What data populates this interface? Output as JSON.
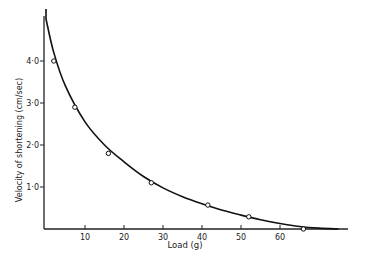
{
  "chart_data": {
    "type": "scatter",
    "title": "",
    "xlabel": "Load (g)",
    "ylabel": "Velocity of shortening (cm/sec)",
    "xlim": [
      0,
      76
    ],
    "ylim": [
      0,
      5.2
    ],
    "x_ticks": [
      10,
      20,
      30,
      40,
      50,
      60
    ],
    "x_tick_labels": [
      "10",
      "20",
      "30",
      "40",
      "50",
      "60"
    ],
    "y_ticks": [
      1.0,
      2.0,
      3.0,
      4.0
    ],
    "y_tick_labels": [
      "1·0",
      "2·0",
      "3·0",
      "4·0"
    ],
    "grid": false,
    "legend": null,
    "series": [
      {
        "name": "measured",
        "marker": "open-circle",
        "x": [
          2,
          7.4,
          16,
          27,
          41.5,
          52,
          66
        ],
        "y": [
          4.0,
          2.9,
          1.8,
          1.1,
          0.57,
          0.29,
          0.0
        ]
      },
      {
        "name": "fitted curve",
        "style": "solid-line",
        "x": [
          0,
          2,
          5,
          10,
          15,
          20,
          25,
          30,
          35,
          40,
          45,
          50,
          55,
          60,
          65,
          70,
          75
        ],
        "y": [
          5.0,
          4.2,
          3.4,
          2.55,
          2.0,
          1.6,
          1.25,
          0.98,
          0.77,
          0.6,
          0.45,
          0.33,
          0.22,
          0.13,
          0.06,
          0.02,
          0.0
        ]
      }
    ]
  }
}
